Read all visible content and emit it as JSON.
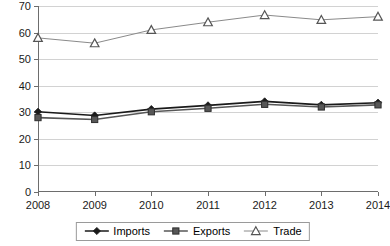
{
  "chart_data": {
    "type": "line",
    "title": "",
    "xlabel": "",
    "ylabel": "",
    "categories": [
      "2008",
      "2009",
      "2010",
      "2011",
      "2012",
      "2013",
      "2014"
    ],
    "x": [
      2008,
      2009,
      2010,
      2011,
      2012,
      2013,
      2014
    ],
    "ylim": [
      0,
      70
    ],
    "xlim": [
      2008,
      2014
    ],
    "y_ticks": [
      "0",
      "10",
      "20",
      "30",
      "40",
      "50",
      "60",
      "70"
    ],
    "y_tick_values": [
      0,
      10,
      20,
      30,
      40,
      50,
      60,
      70
    ],
    "grid": "horizontal",
    "legend_position": "bottom-center",
    "series": [
      {
        "name": "Imports",
        "marker": "filled-diamond",
        "color": "#1a1a1a",
        "values": [
          30.2,
          28.8,
          31.2,
          32.6,
          34.1,
          32.8,
          33.6
        ]
      },
      {
        "name": "Exports",
        "marker": "filled-square",
        "color": "#575757",
        "values": [
          28.0,
          27.3,
          30.2,
          31.5,
          33.0,
          32.0,
          32.8
        ]
      },
      {
        "name": "Trade",
        "marker": "open-triangle",
        "color": "#8a8a8a",
        "values": [
          58.0,
          56.0,
          61.0,
          63.9,
          66.6,
          64.8,
          66.0
        ]
      }
    ]
  },
  "legend": {
    "items": [
      {
        "label": "Imports",
        "marker": "filled-diamond"
      },
      {
        "label": "Exports",
        "marker": "filled-square"
      },
      {
        "label": "Trade",
        "marker": "open-triangle"
      }
    ]
  },
  "axes": {
    "y_labels": [
      "70",
      "60",
      "50",
      "40",
      "30",
      "20",
      "10",
      "0"
    ],
    "x_labels": [
      "2008",
      "2009",
      "2010",
      "2011",
      "2012",
      "2013",
      "2014"
    ]
  },
  "colors": {
    "imports": "#1a1a1a",
    "exports": "#575757",
    "trade": "#8a8a8a",
    "gridline": "#d2d2d2",
    "axis": "#6d6d6d",
    "background": "#ffffff"
  }
}
